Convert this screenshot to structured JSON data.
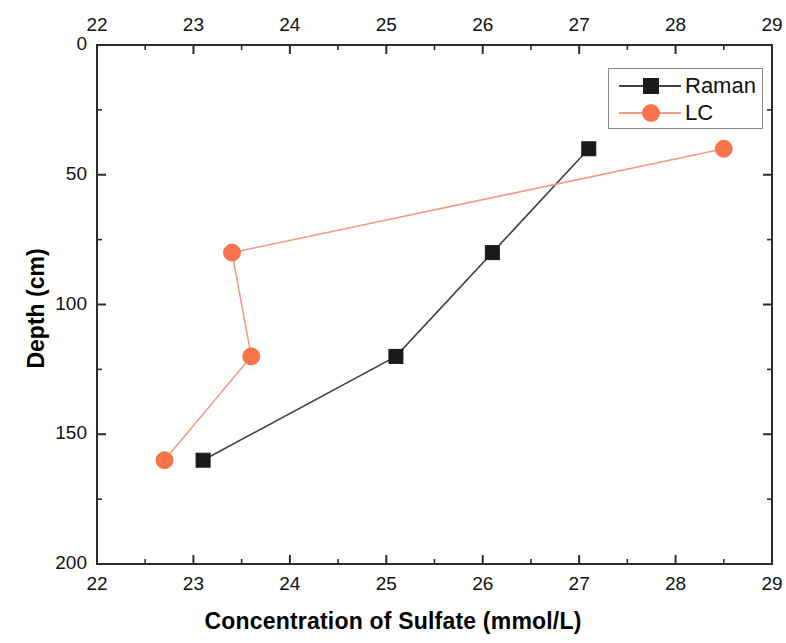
{
  "chart_data": {
    "type": "line",
    "title": "",
    "xlabel": "Concentration of Sulfate (mmol/L)",
    "ylabel": "Depth (cm)",
    "xlim": [
      22,
      29
    ],
    "ylim": [
      0,
      200
    ],
    "y_inverted": true,
    "x_axis_position": "both",
    "grid": false,
    "xticks": [
      22,
      23,
      24,
      25,
      26,
      27,
      28,
      29
    ],
    "xtick_labels": [
      "22",
      "23",
      "24",
      "25",
      "26",
      "27",
      "28",
      "29"
    ],
    "x_minor_tick_interval": 0.5,
    "yticks": [
      0,
      50,
      100,
      150,
      200
    ],
    "ytick_labels": [
      "0",
      "50",
      "100",
      "150",
      "200"
    ],
    "y_minor_tick_interval": 25,
    "legend_position": "top-right",
    "series": [
      {
        "name": "Raman",
        "color": "#404040",
        "marker": "square",
        "marker_color": "#1a1a1a",
        "x": [
          27.1,
          26.1,
          25.1,
          23.1
        ],
        "y": [
          40,
          80,
          120,
          160
        ]
      },
      {
        "name": "LC",
        "color": "#F79A80",
        "marker": "circle",
        "marker_color": "#F9744B",
        "x": [
          28.5,
          23.4,
          23.6,
          22.7
        ],
        "y": [
          40,
          80,
          120,
          160
        ]
      }
    ]
  },
  "legend": {
    "entries": [
      {
        "label": "Raman"
      },
      {
        "label": "LC"
      }
    ]
  },
  "axes": {
    "x_label": "Concentration of Sulfate (mmol/L)",
    "y_label": "Depth (cm)"
  }
}
